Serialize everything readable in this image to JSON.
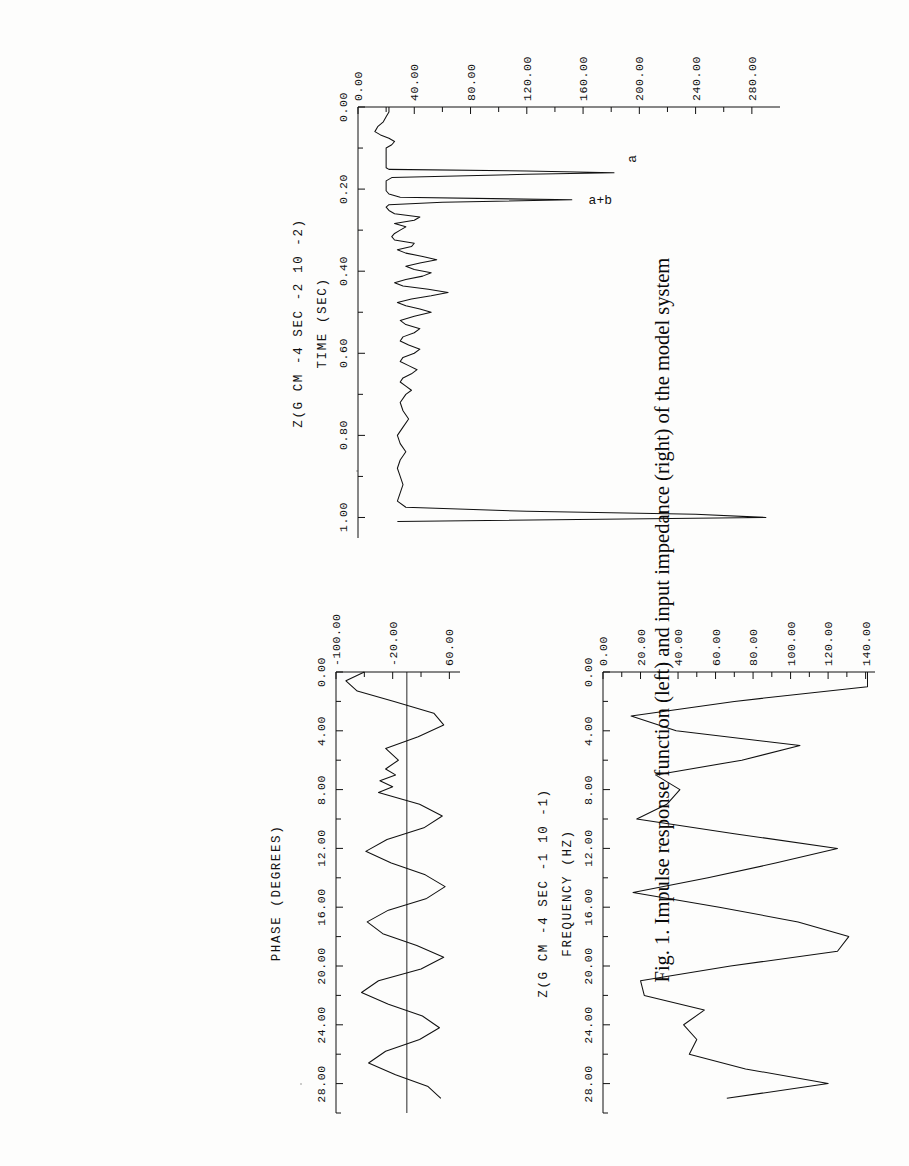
{
  "caption": {
    "text": "Fig. 1. Impulse response function (left) and input impedance (right) of the model system"
  },
  "figure": {
    "id": "Fig. 1",
    "panels": [
      "impulse-response",
      "input-impedance-magnitude",
      "input-impedance-phase"
    ]
  },
  "chart_data": [
    {
      "type": "line",
      "name": "impulse-response",
      "title": "",
      "xlabel": "TIME (SEC)",
      "ylabel": "Z(G CM -4 SEC -2 10 -2)",
      "xlim": [
        0.0,
        1.05
      ],
      "ylim": [
        0.0,
        300.0
      ],
      "xticks": [
        "0.00",
        "0.20",
        "0.40",
        "0.60",
        "0.80",
        "1.00"
      ],
      "xtickvals": [
        0.0,
        0.2,
        0.4,
        0.6,
        0.8,
        1.0
      ],
      "yticks": [
        "0.00",
        "40.00",
        "80.00",
        "120.00",
        "160.00",
        "200.00",
        "240.00",
        "280.00"
      ],
      "ytickvals": [
        0,
        40,
        80,
        120,
        160,
        200,
        240,
        280
      ],
      "grid": false,
      "legend": "none",
      "annotations": [
        {
          "label": "a",
          "x": 0.155,
          "y": 182
        },
        {
          "label": "a+b",
          "x": 0.225,
          "y": 152
        }
      ],
      "x": [
        0.0,
        0.012,
        0.024,
        0.036,
        0.048,
        0.06,
        0.068,
        0.076,
        0.084,
        0.092,
        0.1,
        0.108,
        0.116,
        0.124,
        0.132,
        0.14,
        0.148,
        0.152,
        0.156,
        0.16,
        0.164,
        0.172,
        0.18,
        0.188,
        0.196,
        0.204,
        0.212,
        0.22,
        0.226,
        0.232,
        0.238,
        0.244,
        0.252,
        0.26,
        0.268,
        0.276,
        0.284,
        0.292,
        0.3,
        0.308,
        0.316,
        0.324,
        0.332,
        0.34,
        0.348,
        0.356,
        0.364,
        0.372,
        0.38,
        0.388,
        0.396,
        0.404,
        0.412,
        0.42,
        0.428,
        0.436,
        0.444,
        0.452,
        0.46,
        0.468,
        0.476,
        0.484,
        0.492,
        0.5,
        0.51,
        0.52,
        0.53,
        0.54,
        0.55,
        0.56,
        0.57,
        0.58,
        0.59,
        0.6,
        0.61,
        0.62,
        0.63,
        0.64,
        0.65,
        0.66,
        0.67,
        0.68,
        0.69,
        0.7,
        0.72,
        0.74,
        0.76,
        0.78,
        0.8,
        0.82,
        0.84,
        0.86,
        0.88,
        0.9,
        0.92,
        0.94,
        0.96,
        0.975,
        0.985,
        0.992,
        1.0,
        1.01
      ],
      "values": [
        22,
        22,
        20,
        18,
        14,
        12,
        16,
        22,
        26,
        24,
        20,
        20,
        20,
        20,
        20,
        20,
        20,
        22,
        120,
        182,
        120,
        24,
        20,
        20,
        20,
        20,
        22,
        30,
        152,
        60,
        22,
        20,
        22,
        26,
        44,
        40,
        26,
        34,
        30,
        26,
        24,
        26,
        40,
        38,
        28,
        34,
        46,
        56,
        44,
        34,
        40,
        52,
        46,
        34,
        26,
        32,
        50,
        64,
        52,
        38,
        28,
        34,
        44,
        52,
        40,
        30,
        34,
        44,
        40,
        32,
        30,
        36,
        44,
        40,
        32,
        30,
        36,
        42,
        38,
        32,
        30,
        34,
        38,
        34,
        30,
        32,
        36,
        32,
        28,
        30,
        34,
        30,
        28,
        30,
        32,
        30,
        28,
        34,
        120,
        240,
        290,
        28
      ]
    },
    {
      "type": "line",
      "name": "input-impedance-magnitude",
      "title": "",
      "xlabel": "FREQUENCY (HZ)",
      "ylabel": "Z(G CM -4 SEC -1 10 -1)",
      "xlim": [
        0.0,
        30.0
      ],
      "ylim": [
        0.0,
        145.0
      ],
      "xticks": [
        "0.00",
        "4.00",
        "8.00",
        "12.00",
        "16.00",
        "20.00",
        "24.00",
        "28.00"
      ],
      "xtickvals": [
        0,
        4,
        8,
        12,
        16,
        20,
        24,
        28
      ],
      "yticks": [
        "0.00",
        "20.00",
        "40.00",
        "60.00",
        "80.00",
        "100.00",
        "120.00",
        "140.00"
      ],
      "ytickvals": [
        0,
        20,
        40,
        60,
        80,
        100,
        120,
        140
      ],
      "grid": false,
      "legend": "none",
      "x": [
        0.0,
        1.0,
        2.0,
        3.0,
        4.0,
        5.0,
        6.0,
        7.0,
        8.0,
        9.0,
        10.0,
        11.0,
        12.0,
        13.0,
        14.0,
        15.0,
        16.0,
        17.0,
        18.0,
        19.0,
        20.0,
        21.0,
        22.0,
        23.0,
        24.0,
        25.0,
        26.0,
        27.0,
        28.0,
        29.0
      ],
      "values": [
        141,
        141,
        70,
        15,
        39,
        105,
        74,
        28,
        41,
        34,
        18,
        70,
        125,
        92,
        56,
        16,
        62,
        104,
        131,
        125,
        68,
        20,
        22,
        54,
        43,
        50,
        46,
        76,
        120,
        66
      ]
    },
    {
      "type": "line",
      "name": "input-impedance-phase",
      "title": "",
      "xlabel": "FREQUENCY (HZ)",
      "ylabel": "PHASE (DEGREES)",
      "xlim": [
        0.0,
        30.0
      ],
      "ylim": [
        -100.0,
        75.0
      ],
      "xticks": [
        "0.00",
        "4.00",
        "8.00",
        "12.00",
        "16.00",
        "20.00",
        "24.00",
        "28.00"
      ],
      "xtickvals": [
        0,
        4,
        8,
        12,
        16,
        20,
        24,
        28
      ],
      "yticks": [
        "-100.00",
        "-20.00",
        "60.00"
      ],
      "ytickvals": [
        -100,
        -20,
        60
      ],
      "grid": false,
      "zeroline": true,
      "legend": "none",
      "x": [
        0.0,
        0.6,
        1.3,
        2.0,
        2.8,
        3.6,
        4.4,
        5.2,
        6.0,
        6.6,
        7.0,
        7.4,
        7.8,
        8.2,
        9.0,
        9.8,
        10.6,
        11.4,
        12.2,
        13.0,
        13.8,
        14.6,
        15.4,
        16.2,
        17.0,
        17.8,
        18.6,
        19.4,
        20.2,
        21.0,
        21.8,
        22.6,
        23.4,
        24.2,
        25.0,
        25.8,
        26.6,
        27.4,
        28.2,
        29.0
      ],
      "values": [
        -60,
        -86,
        -70,
        -18,
        38,
        52,
        16,
        -30,
        -12,
        -30,
        -16,
        -38,
        -20,
        -40,
        18,
        50,
        24,
        -28,
        -58,
        -22,
        26,
        54,
        28,
        -26,
        -56,
        -34,
        14,
        52,
        20,
        -40,
        -64,
        -26,
        22,
        46,
        18,
        -30,
        -54,
        -16,
        30,
        48
      ]
    }
  ],
  "axis_titles": {
    "time": "TIME (SEC)",
    "frequency": "FREQUENCY (HZ)",
    "impulse_y": "Z(G CM -4 SEC -2 10 -2)",
    "magnitude_y": "Z(G CM -4 SEC -1 10 -1)",
    "phase_y": "PHASE (DEGREES)"
  }
}
